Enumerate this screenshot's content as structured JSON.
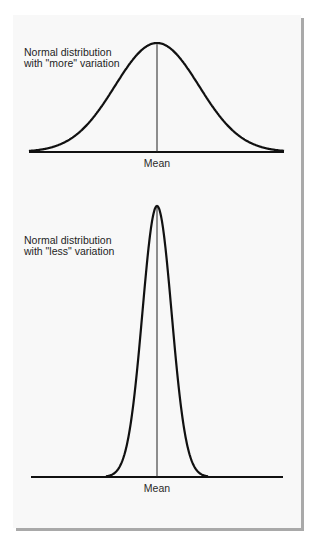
{
  "diagrams": [
    {
      "label_line1": "Normal distribution",
      "label_line2": "with \"more\" variation",
      "axis_label": "Mean",
      "variation": "more"
    },
    {
      "label_line1": "Normal distribution",
      "label_line2": "with \"less\" variation",
      "axis_label": "Mean",
      "variation": "less"
    }
  ],
  "colors": {
    "curve": "#111111",
    "paper": "#f8f8f8",
    "shadow": "#a9a9a9"
  }
}
